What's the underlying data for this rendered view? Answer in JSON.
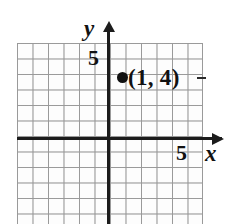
{
  "figure": {
    "type": "coordinate-plane",
    "background_color": "#ffffff",
    "grid_color": "#9a9a9a",
    "axis_color": "#1c1c1c",
    "point_color": "#111111"
  },
  "axes": {
    "x_label": "x",
    "y_label": "y",
    "x_tick_label": "5",
    "y_tick_label": "5",
    "x_arrow_icon": "arrow-right-icon",
    "y_arrow_icon": "arrow-up-icon"
  },
  "point": {
    "label": "(1, 4)",
    "x": 1,
    "y": 4,
    "marker_icon": "filled-circle-icon"
  },
  "chart_data": {
    "type": "scatter",
    "title": "",
    "xlabel": "x",
    "ylabel": "y",
    "grid": true,
    "legend": "none",
    "xlim": [
      -6,
      6
    ],
    "ylim": [
      -6,
      7
    ],
    "xticks": [
      5
    ],
    "yticks": [
      5
    ],
    "grid_step": 1,
    "points": [
      {
        "x": 1,
        "y": 4,
        "label": "(1, 4)"
      }
    ]
  }
}
